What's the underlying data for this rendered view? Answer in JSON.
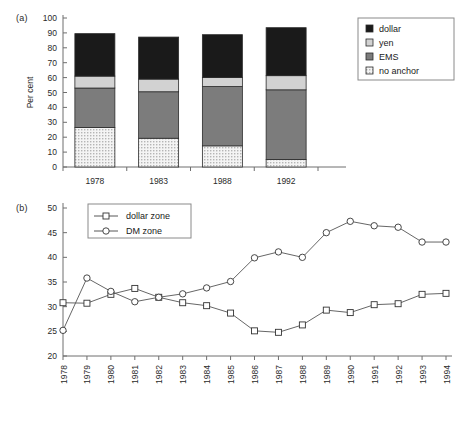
{
  "figure": {
    "panel_a_tag": "(a)",
    "panel_b_tag": "(b)"
  },
  "chart_data": [
    {
      "id": "panel_a",
      "type": "bar",
      "stacked": true,
      "title": "",
      "xlabel": "",
      "ylabel": "Per cent",
      "ylim": [
        0,
        100
      ],
      "yticks": [
        0,
        10,
        20,
        30,
        40,
        50,
        60,
        70,
        80,
        90,
        100
      ],
      "grid": false,
      "legend_position": "right",
      "categories": [
        "1978",
        "1983",
        "1988",
        "1992"
      ],
      "series": [
        {
          "name": "no anchor",
          "values": [
            26.5,
            19.3,
            14.2,
            5.0
          ],
          "fill": "#e8e8e8",
          "pattern": "dots"
        },
        {
          "name": "EMS",
          "values": [
            26.5,
            31.2,
            39.8,
            46.8
          ],
          "fill": "#7c7c7c",
          "pattern": "solid"
        },
        {
          "name": "yen",
          "values": [
            8.0,
            8.5,
            6.0,
            9.5
          ],
          "fill": "#d2d2d2",
          "pattern": "solid"
        },
        {
          "name": "dollar",
          "values": [
            28.5,
            28.2,
            28.8,
            32.2
          ],
          "fill": "#1a1a1a",
          "pattern": "solid"
        }
      ],
      "legend_entries": [
        {
          "label": "dollar",
          "fill": "#1a1a1a",
          "pattern": "solid"
        },
        {
          "label": "yen",
          "fill": "#d2d2d2",
          "pattern": "solid"
        },
        {
          "label": "EMS",
          "fill": "#7c7c7c",
          "pattern": "solid"
        },
        {
          "label": "no anchor",
          "fill": "#f2f2f2",
          "pattern": "dots"
        }
      ],
      "totals": [
        89.5,
        87.2,
        88.8,
        93.5
      ]
    },
    {
      "id": "panel_b",
      "type": "line",
      "title": "",
      "xlabel": "",
      "ylabel": "",
      "ylim": [
        20,
        50
      ],
      "yticks": [
        20,
        25,
        30,
        35,
        40,
        45,
        50
      ],
      "grid": false,
      "legend_position": "top-left",
      "x": [
        "1978",
        "1979",
        "1980",
        "1981",
        "1982",
        "1983",
        "1984",
        "1985",
        "1986",
        "1987",
        "1988",
        "1989",
        "1990",
        "1991",
        "1992",
        "1993",
        "1994"
      ],
      "series": [
        {
          "name": "dollar zone",
          "marker": "square",
          "values": [
            30.8,
            30.7,
            32.5,
            33.7,
            31.9,
            30.8,
            30.2,
            28.7,
            25.1,
            24.8,
            26.3,
            29.3,
            28.8,
            30.4,
            30.6,
            32.5,
            32.7
          ]
        },
        {
          "name": "DM zone",
          "marker": "circle",
          "values": [
            25.2,
            35.8,
            33.1,
            31.0,
            31.9,
            32.6,
            33.8,
            35.1,
            39.9,
            41.1,
            40.0,
            45.0,
            47.3,
            46.4,
            46.1,
            43.1,
            43.1
          ]
        }
      ]
    }
  ]
}
